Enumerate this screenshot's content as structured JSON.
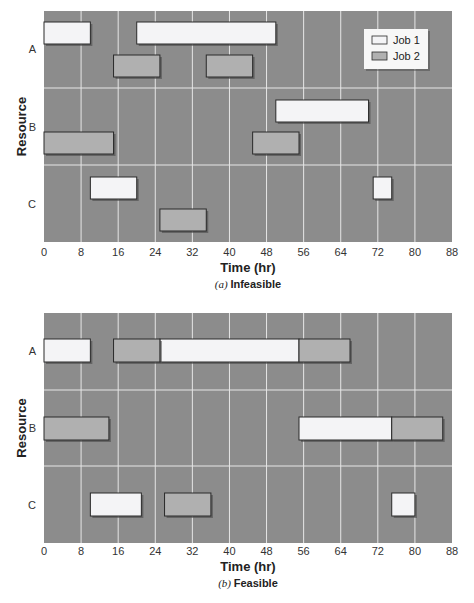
{
  "chart_data": [
    {
      "type": "gantt",
      "title": "(a) Infeasible",
      "caption_prefix": "(a)",
      "caption_text": "Infeasible",
      "xlabel": "Time (hr)",
      "ylabel": "Resource",
      "xlim": [
        0,
        88
      ],
      "xticks": [
        0,
        8,
        16,
        24,
        32,
        40,
        48,
        56,
        64,
        72,
        80,
        88
      ],
      "resources": [
        "A",
        "B",
        "C"
      ],
      "grid": true,
      "legend": {
        "position": "upper right",
        "entries": [
          "Job 1",
          "Job 2"
        ]
      },
      "series": [
        {
          "name": "Job 1",
          "tasks": [
            {
              "resource": "A",
              "start": 0,
              "end": 10
            },
            {
              "resource": "A",
              "start": 20,
              "end": 50
            },
            {
              "resource": "B",
              "start": 50,
              "end": 70
            },
            {
              "resource": "C",
              "start": 10,
              "end": 20
            },
            {
              "resource": "C",
              "start": 71,
              "end": 75
            }
          ]
        },
        {
          "name": "Job 2",
          "tasks": [
            {
              "resource": "A",
              "start": 15,
              "end": 25
            },
            {
              "resource": "A",
              "start": 35,
              "end": 45
            },
            {
              "resource": "B",
              "start": 0,
              "end": 15
            },
            {
              "resource": "B",
              "start": 45,
              "end": 55
            },
            {
              "resource": "C",
              "start": 25,
              "end": 35
            }
          ]
        }
      ]
    },
    {
      "type": "gantt",
      "title": "(b) Feasible",
      "caption_prefix": "(b)",
      "caption_text": "Feasible",
      "xlabel": "Time (hr)",
      "ylabel": "Resource",
      "xlim": [
        0,
        88
      ],
      "xticks": [
        0,
        8,
        16,
        24,
        32,
        40,
        48,
        56,
        64,
        72,
        80,
        88
      ],
      "resources": [
        "A",
        "B",
        "C"
      ],
      "grid": true,
      "series": [
        {
          "name": "Job 1",
          "tasks": [
            {
              "resource": "A",
              "start": 0,
              "end": 10
            },
            {
              "resource": "A",
              "start": 25,
              "end": 55
            },
            {
              "resource": "B",
              "start": 55,
              "end": 75
            },
            {
              "resource": "C",
              "start": 10,
              "end": 21
            },
            {
              "resource": "C",
              "start": 75,
              "end": 80
            }
          ]
        },
        {
          "name": "Job 2",
          "tasks": [
            {
              "resource": "A",
              "start": 15,
              "end": 25
            },
            {
              "resource": "A",
              "start": 55,
              "end": 66
            },
            {
              "resource": "B",
              "start": 0,
              "end": 14
            },
            {
              "resource": "B",
              "start": 75,
              "end": 86
            },
            {
              "resource": "C",
              "start": 26,
              "end": 36
            }
          ]
        }
      ]
    }
  ],
  "colors": {
    "plot_bg": "#8c8c8c",
    "grid": "#e6e6e6",
    "job1": "#f4f4f6",
    "job2": "#b0b0b0",
    "bar_border": "#2a2a2a",
    "shadow": "#4a4a4a"
  }
}
